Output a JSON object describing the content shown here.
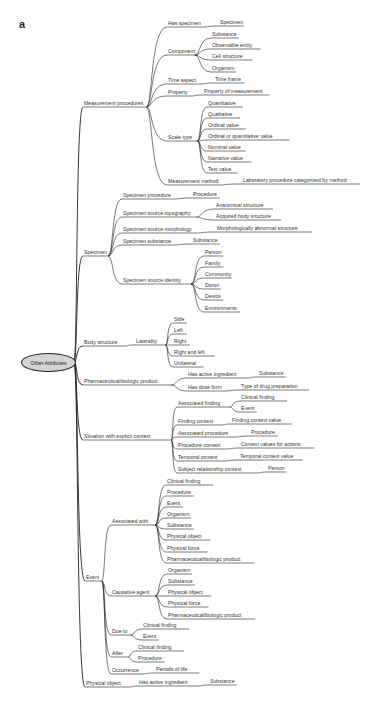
{
  "figure_label": "a",
  "root": {
    "label": "Other Attributes",
    "x": 21,
    "y": 353
  },
  "nodes": [
    {
      "id": "mp",
      "label": "Measurement procedures",
      "x": 84,
      "y": 100,
      "parent": "root"
    },
    {
      "id": "hs",
      "label": "Has specimen",
      "x": 168,
      "y": 20,
      "parent": "mp"
    },
    {
      "id": "hs1",
      "label": "Specimen",
      "x": 220,
      "y": 19,
      "parent": "hs"
    },
    {
      "id": "comp",
      "label": "Component",
      "x": 168,
      "y": 48,
      "parent": "mp"
    },
    {
      "id": "c1",
      "label": "Substance",
      "x": 212,
      "y": 31,
      "parent": "comp"
    },
    {
      "id": "c2",
      "label": "Observable entity",
      "x": 212,
      "y": 42,
      "parent": "comp"
    },
    {
      "id": "c3",
      "label": "Cell structure",
      "x": 212,
      "y": 53,
      "parent": "comp"
    },
    {
      "id": "c4",
      "label": "Organism",
      "x": 212,
      "y": 65,
      "parent": "comp"
    },
    {
      "id": "ta",
      "label": "Time aspect",
      "x": 168,
      "y": 77,
      "parent": "mp"
    },
    {
      "id": "ta1",
      "label": "Time frame",
      "x": 215,
      "y": 76,
      "parent": "ta"
    },
    {
      "id": "prop",
      "label": "Property",
      "x": 168,
      "y": 89,
      "parent": "mp"
    },
    {
      "id": "prop1",
      "label": "Property of measurement",
      "x": 204,
      "y": 88,
      "parent": "prop"
    },
    {
      "id": "st",
      "label": "Scale type",
      "x": 168,
      "y": 134,
      "parent": "mp"
    },
    {
      "id": "s1",
      "label": "Quantitative",
      "x": 208,
      "y": 100,
      "parent": "st"
    },
    {
      "id": "s2",
      "label": "Qualitative",
      "x": 208,
      "y": 111,
      "parent": "st"
    },
    {
      "id": "s3",
      "label": "Ordinal value",
      "x": 208,
      "y": 122,
      "parent": "st"
    },
    {
      "id": "s4",
      "label": "Ordinal or quantitative value",
      "x": 208,
      "y": 133,
      "parent": "st"
    },
    {
      "id": "s5",
      "label": "Nominal value",
      "x": 208,
      "y": 144,
      "parent": "st"
    },
    {
      "id": "s6",
      "label": "Narrative value",
      "x": 208,
      "y": 155,
      "parent": "st"
    },
    {
      "id": "s7",
      "label": "Text value",
      "x": 208,
      "y": 166,
      "parent": "st"
    },
    {
      "id": "mm",
      "label": "Measurement method",
      "x": 168,
      "y": 178,
      "parent": "mp"
    },
    {
      "id": "mm1",
      "label": "Laboratory procedure categorized by method",
      "x": 243,
      "y": 177,
      "parent": "mm"
    },
    {
      "id": "spec",
      "label": "Specimen",
      "x": 84,
      "y": 249,
      "parent": "root"
    },
    {
      "id": "sp1",
      "label": "Specimen procedure",
      "x": 123,
      "y": 192,
      "parent": "spec"
    },
    {
      "id": "sp1a",
      "label": "Procedure",
      "x": 193,
      "y": 191,
      "parent": "sp1"
    },
    {
      "id": "sp2",
      "label": "Specimen source topography",
      "x": 123,
      "y": 210,
      "parent": "spec"
    },
    {
      "id": "sp2a",
      "label": "Anatomical structure",
      "x": 216,
      "y": 202,
      "parent": "sp2"
    },
    {
      "id": "sp2b",
      "label": "Acquired body structure",
      "x": 216,
      "y": 213,
      "parent": "sp2"
    },
    {
      "id": "sp3",
      "label": "Specimen source morphology",
      "x": 123,
      "y": 226,
      "parent": "spec"
    },
    {
      "id": "sp3a",
      "label": "Morphologically abnormal structure",
      "x": 217,
      "y": 225,
      "parent": "sp3"
    },
    {
      "id": "sp4",
      "label": "Specimen substance",
      "x": 123,
      "y": 238,
      "parent": "spec"
    },
    {
      "id": "sp4a",
      "label": "Substance",
      "x": 193,
      "y": 237,
      "parent": "sp4"
    },
    {
      "id": "sp5",
      "label": "Specimen source identity",
      "x": 123,
      "y": 277,
      "parent": "spec"
    },
    {
      "id": "sp5a",
      "label": "Person",
      "x": 205,
      "y": 249,
      "parent": "sp5"
    },
    {
      "id": "sp5b",
      "label": "Family",
      "x": 205,
      "y": 260,
      "parent": "sp5"
    },
    {
      "id": "sp5c",
      "label": "Community",
      "x": 205,
      "y": 271,
      "parent": "sp5"
    },
    {
      "id": "sp5d",
      "label": "Donor",
      "x": 205,
      "y": 282,
      "parent": "sp5"
    },
    {
      "id": "sp5e",
      "label": "Device",
      "x": 205,
      "y": 293,
      "parent": "sp5"
    },
    {
      "id": "sp5f",
      "label": "Environments",
      "x": 205,
      "y": 305,
      "parent": "sp5"
    },
    {
      "id": "bs",
      "label": "Body structure",
      "x": 84,
      "y": 339,
      "parent": "root"
    },
    {
      "id": "lat",
      "label": "Laterality",
      "x": 136,
      "y": 338,
      "parent": "bs"
    },
    {
      "id": "l1",
      "label": "Side",
      "x": 174,
      "y": 316,
      "parent": "lat"
    },
    {
      "id": "l2",
      "label": "Left",
      "x": 174,
      "y": 327,
      "parent": "lat"
    },
    {
      "id": "l3",
      "label": "Right",
      "x": 174,
      "y": 338,
      "parent": "lat"
    },
    {
      "id": "l4",
      "label": "Right and left",
      "x": 174,
      "y": 349,
      "parent": "lat"
    },
    {
      "id": "l5",
      "label": "Unilateral",
      "x": 174,
      "y": 360,
      "parent": "lat"
    },
    {
      "id": "pbp",
      "label": "Pharmaceutical/biologic product",
      "x": 84,
      "y": 378,
      "parent": "root"
    },
    {
      "id": "hai",
      "label": "Has active ingredient",
      "x": 188,
      "y": 371,
      "parent": "pbp"
    },
    {
      "id": "hai1",
      "label": "Substance",
      "x": 259,
      "y": 370,
      "parent": "hai"
    },
    {
      "id": "hdf",
      "label": "Has dose form",
      "x": 188,
      "y": 384,
      "parent": "pbp"
    },
    {
      "id": "hdf1",
      "label": "Type of drug preparation",
      "x": 241,
      "y": 383,
      "parent": "hdf"
    },
    {
      "id": "sec",
      "label": "Situation with explicit context",
      "x": 84,
      "y": 433,
      "parent": "root"
    },
    {
      "id": "af",
      "label": "Associated finding",
      "x": 178,
      "y": 400,
      "parent": "sec"
    },
    {
      "id": "af1",
      "label": "Clinical finding",
      "x": 241,
      "y": 394,
      "parent": "af"
    },
    {
      "id": "af2",
      "label": "Event",
      "x": 241,
      "y": 405,
      "parent": "af"
    },
    {
      "id": "fc",
      "label": "Finding context",
      "x": 178,
      "y": 418,
      "parent": "sec"
    },
    {
      "id": "fc1",
      "label": "Finding context value",
      "x": 232,
      "y": 417,
      "parent": "fc"
    },
    {
      "id": "ap",
      "label": "Associated procedure",
      "x": 178,
      "y": 430,
      "parent": "sec"
    },
    {
      "id": "ap1",
      "label": "Procedure",
      "x": 251,
      "y": 429,
      "parent": "ap"
    },
    {
      "id": "pc",
      "label": "Procedure context",
      "x": 178,
      "y": 442,
      "parent": "sec"
    },
    {
      "id": "pc1",
      "label": "Context values for actions",
      "x": 241,
      "y": 441,
      "parent": "pc"
    },
    {
      "id": "tc",
      "label": "Temporal context",
      "x": 178,
      "y": 454,
      "parent": "sec"
    },
    {
      "id": "tc1",
      "label": "Temporal context value",
      "x": 240,
      "y": 453,
      "parent": "tc"
    },
    {
      "id": "src",
      "label": "Subject relationship context",
      "x": 178,
      "y": 466,
      "parent": "sec"
    },
    {
      "id": "src1",
      "label": "Person",
      "x": 268,
      "y": 465,
      "parent": "src"
    },
    {
      "id": "ev",
      "label": "Event",
      "x": 86,
      "y": 574,
      "parent": "root"
    },
    {
      "id": "aw",
      "label": "Associated with",
      "x": 112,
      "y": 518,
      "parent": "ev"
    },
    {
      "id": "aw1",
      "label": "Clinical finding",
      "x": 167,
      "y": 478,
      "parent": "aw"
    },
    {
      "id": "aw2",
      "label": "Procedure",
      "x": 167,
      "y": 489,
      "parent": "aw"
    },
    {
      "id": "aw3",
      "label": "Event",
      "x": 167,
      "y": 500,
      "parent": "aw"
    },
    {
      "id": "aw4",
      "label": "Organism",
      "x": 167,
      "y": 511,
      "parent": "aw"
    },
    {
      "id": "aw5",
      "label": "Substance",
      "x": 167,
      "y": 522,
      "parent": "aw"
    },
    {
      "id": "aw6",
      "label": "Physical object",
      "x": 167,
      "y": 533,
      "parent": "aw"
    },
    {
      "id": "aw7",
      "label": "Physical force",
      "x": 167,
      "y": 545,
      "parent": "aw"
    },
    {
      "id": "aw8",
      "label": "Pharmaceutical/biologic product",
      "x": 167,
      "y": 556,
      "parent": "aw"
    },
    {
      "id": "ca",
      "label": "Causative agent",
      "x": 112,
      "y": 589,
      "parent": "ev"
    },
    {
      "id": "ca1",
      "label": "Organism",
      "x": 168,
      "y": 567,
      "parent": "ca"
    },
    {
      "id": "ca2",
      "label": "Substance",
      "x": 168,
      "y": 578,
      "parent": "ca"
    },
    {
      "id": "ca3",
      "label": "Physical object",
      "x": 168,
      "y": 589,
      "parent": "ca"
    },
    {
      "id": "ca4",
      "label": "Physical force",
      "x": 168,
      "y": 600,
      "parent": "ca"
    },
    {
      "id": "ca5",
      "label": "Pharmaceutical/biologic product",
      "x": 168,
      "y": 612,
      "parent": "ca"
    },
    {
      "id": "dt",
      "label": "Due to",
      "x": 112,
      "y": 628,
      "parent": "ev"
    },
    {
      "id": "dt1",
      "label": "Clinical finding",
      "x": 143,
      "y": 622,
      "parent": "dt"
    },
    {
      "id": "dt2",
      "label": "Event",
      "x": 143,
      "y": 633,
      "parent": "dt"
    },
    {
      "id": "aft",
      "label": "After",
      "x": 112,
      "y": 650,
      "parent": "ev"
    },
    {
      "id": "aft1",
      "label": "Clinical finding",
      "x": 138,
      "y": 644,
      "parent": "aft"
    },
    {
      "id": "aft2",
      "label": "Procedure",
      "x": 138,
      "y": 655,
      "parent": "aft"
    },
    {
      "id": "occ",
      "label": "Occurrence",
      "x": 112,
      "y": 667,
      "parent": "ev"
    },
    {
      "id": "occ1",
      "label": "Periods of life",
      "x": 156,
      "y": 666,
      "parent": "occ"
    },
    {
      "id": "po",
      "label": "Physical object",
      "x": 86,
      "y": 680,
      "parent": "root"
    },
    {
      "id": "po1",
      "label": "Has active ingredient",
      "x": 139,
      "y": 679,
      "parent": "po"
    },
    {
      "id": "po2",
      "label": "Substance",
      "x": 210,
      "y": 678,
      "parent": "po1"
    }
  ],
  "colors": {
    "line": "#222222",
    "text": "#333333",
    "root_fill": "#d4d4d4"
  }
}
